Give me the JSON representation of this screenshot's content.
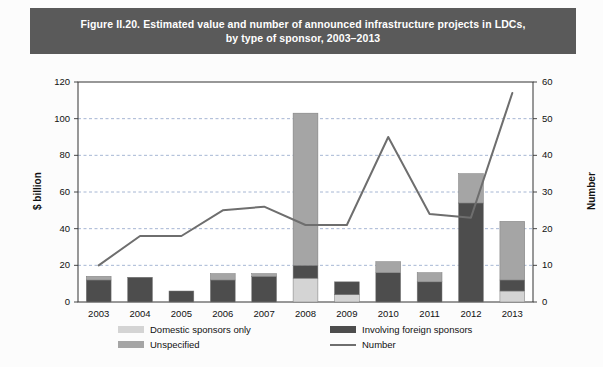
{
  "figure": {
    "title_line1": "Figure II.20. Estimated value and number of announced infrastructure projects in LDCs,",
    "title_line2": "by type of sponsor, 2003–2013",
    "title_bg": "#5a5a5a",
    "title_color": "#ffffff"
  },
  "axes": {
    "left_label": "$ billion",
    "right_label": "Number",
    "left_ticks": [
      "0",
      "20",
      "40",
      "60",
      "80",
      "100",
      "120"
    ],
    "right_ticks": [
      "0",
      "10",
      "20",
      "30",
      "40",
      "50",
      "60"
    ]
  },
  "legend": {
    "items": [
      {
        "label": "Domestic sponsors only",
        "color": "#d4d4d4",
        "type": "swatch",
        "icon": "legend-swatch-icon"
      },
      {
        "label": "Involving foreign sponsors",
        "color": "#4d4d4d",
        "type": "swatch",
        "icon": "legend-swatch-icon"
      },
      {
        "label": "Unspecified",
        "color": "#a5a5a5",
        "type": "swatch",
        "icon": "legend-swatch-icon"
      },
      {
        "label": "Number",
        "color": "#6e6e6e",
        "type": "line",
        "icon": "legend-line-icon"
      }
    ]
  },
  "chart_data": {
    "type": "bar",
    "title": "Figure II.20. Estimated value and number of announced infrastructure projects in LDCs, by type of sponsor, 2003–2013",
    "xlabel": "",
    "ylabel": "$ billion",
    "y2label": "Number",
    "ylim": [
      0,
      120
    ],
    "y2lim": [
      0,
      60
    ],
    "grid": true,
    "legend_position": "bottom",
    "stacked": true,
    "categories": [
      "2003",
      "2004",
      "2005",
      "2006",
      "2007",
      "2008",
      "2009",
      "2010",
      "2011",
      "2012",
      "2013"
    ],
    "series": [
      {
        "name": "Domestic sponsors only",
        "color": "#d4d4d4",
        "axis": "left",
        "values": [
          0,
          0,
          0,
          0,
          0,
          13,
          4,
          0,
          0,
          0,
          6
        ]
      },
      {
        "name": "Involving foreign sponsors",
        "color": "#4d4d4d",
        "axis": "left",
        "values": [
          12,
          13.5,
          6,
          12,
          14,
          7,
          7,
          16,
          11,
          54,
          6
        ]
      },
      {
        "name": "Unspecified",
        "color": "#a5a5a5",
        "axis": "left",
        "values": [
          2,
          0,
          0,
          3.5,
          1.5,
          83,
          0,
          6,
          5,
          16,
          32
        ]
      },
      {
        "name": "Number",
        "color": "#6e6e6e",
        "axis": "right",
        "type": "line",
        "values": [
          10,
          18,
          18,
          25,
          26,
          21,
          21,
          45,
          24,
          23,
          57
        ]
      }
    ]
  }
}
